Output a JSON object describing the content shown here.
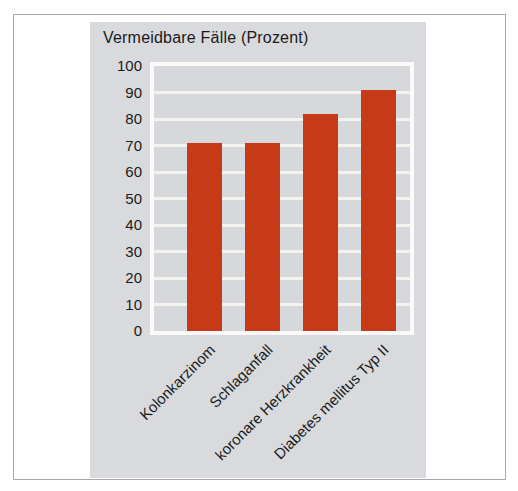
{
  "figure": {
    "border_color": "#a8a8a8",
    "background": "#ffffff"
  },
  "chart_data": {
    "type": "bar",
    "title": "Vermeidbare Fälle (Prozent)",
    "categories": [
      "Kolonkarzinom",
      "Schlaganfall",
      "koronare Herzkrankheit",
      "Diabetes mellitus Typ II"
    ],
    "values": [
      71,
      71,
      82,
      91
    ],
    "xlabel": "",
    "ylabel": "",
    "ylim": [
      0,
      100
    ],
    "yticks": [
      0,
      10,
      20,
      30,
      40,
      50,
      60,
      70,
      80,
      90,
      100
    ],
    "grid": "horizontal",
    "legend_position": "none",
    "colors": {
      "bar": "#c73a18",
      "panel_background": "#d8dade",
      "plot_background": "#d6d8dc",
      "gridline": "#f2f2ef",
      "plot_border": "#fafaf8",
      "text": "#1a1a1a"
    }
  }
}
